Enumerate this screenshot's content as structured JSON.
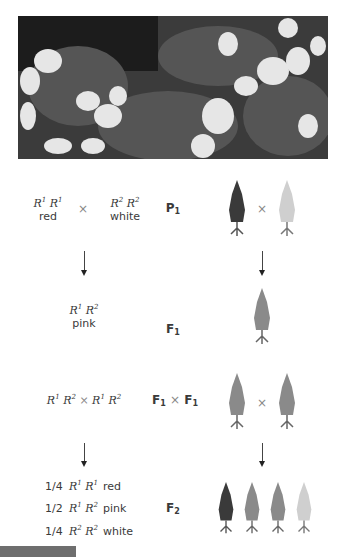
{
  "photo": {
    "description": "snapdragon-flowers-photo",
    "tone": "grayscale"
  },
  "rows": {
    "p1": {
      "left_genotype": {
        "a": "R",
        "a_sup": "1",
        "b": "R",
        "b_sup": "1"
      },
      "left_phenotype": "red",
      "cross": "×",
      "right_genotype": {
        "a": "R",
        "a_sup": "2",
        "b": "R",
        "b_sup": "2"
      },
      "right_phenotype": "white",
      "generation": {
        "base": "P",
        "sub": "1"
      },
      "plants": [
        "red",
        "white"
      ]
    },
    "f1": {
      "genotype": {
        "a": "R",
        "a_sup": "1",
        "b": "R",
        "b_sup": "2"
      },
      "phenotype": "pink",
      "generation": {
        "base": "F",
        "sub": "1"
      },
      "plants": [
        "pink"
      ]
    },
    "f1xf1": {
      "cross_text": {
        "a": "R",
        "a_sup": "1",
        "b": "R",
        "b_sup": "2",
        "x": "×",
        "c": "R",
        "c_sup": "1",
        "d": "R",
        "d_sup": "2"
      },
      "generation": {
        "left": "F",
        "left_sub": "1",
        "x": "×",
        "right": "F",
        "right_sub": "1"
      },
      "plants": [
        "pink",
        "pink"
      ]
    },
    "f2": {
      "generation": {
        "base": "F",
        "sub": "2"
      },
      "ratios": [
        {
          "fraction": "1/4",
          "a": "R",
          "a_sup": "1",
          "b": "R",
          "b_sup": "1",
          "phenotype": "red"
        },
        {
          "fraction": "1/2",
          "a": "R",
          "a_sup": "1",
          "b": "R",
          "b_sup": "2",
          "phenotype": "pink"
        },
        {
          "fraction": "1/4",
          "a": "R",
          "a_sup": "2",
          "b": "R",
          "b_sup": "2",
          "phenotype": "white"
        }
      ],
      "plants": [
        "red",
        "pink",
        "pink",
        "white"
      ]
    }
  },
  "colors": {
    "red_plant": "#3a3a3a",
    "pink_plant": "#8a8a8a",
    "white_plant": "#c8c8c8",
    "bar": "#6e6e6e"
  }
}
